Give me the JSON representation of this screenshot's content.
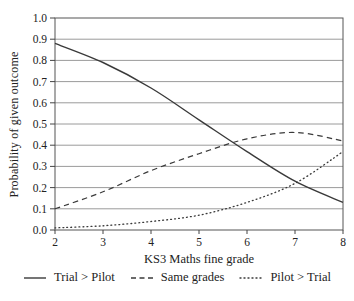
{
  "figure": {
    "background": "#ffffff"
  },
  "chart_data": {
    "type": "line",
    "x": [
      2,
      3,
      4,
      5,
      6,
      7,
      8
    ],
    "series": [
      {
        "name": "Trial > Pilot",
        "style": "solid",
        "values": [
          0.88,
          0.79,
          0.67,
          0.52,
          0.37,
          0.23,
          0.13
        ]
      },
      {
        "name": "Same grades",
        "style": "dashed",
        "values": [
          0.1,
          0.18,
          0.28,
          0.36,
          0.43,
          0.46,
          0.42
        ]
      },
      {
        "name": "Pilot > Trial",
        "style": "dotted",
        "values": [
          0.01,
          0.02,
          0.04,
          0.07,
          0.13,
          0.22,
          0.37
        ]
      }
    ],
    "title": "",
    "xlabel": "KS3 Maths fine grade",
    "ylabel": "Probability of given outcome",
    "xlim": [
      2,
      8
    ],
    "ylim": [
      0.0,
      1.0
    ],
    "x_ticks": [
      "2",
      "3",
      "4",
      "5",
      "6",
      "7",
      "8"
    ],
    "y_ticks": [
      "0.0",
      "0.1",
      "0.2",
      "0.3",
      "0.4",
      "0.5",
      "0.6",
      "0.7",
      "0.8",
      "0.9",
      "1.0"
    ],
    "grid": "horizontal",
    "legend_position": "bottom"
  },
  "legend": {
    "items": [
      {
        "label": "Trial > Pilot",
        "style": "solid"
      },
      {
        "label": "Same grades",
        "style": "dashed"
      },
      {
        "label": "Pilot > Trial",
        "style": "dotted"
      }
    ]
  },
  "colors": {
    "line": "#3a3a3a",
    "grid": "#8f8f8f",
    "axis": "#555555",
    "text": "#222222",
    "background": "#ffffff"
  }
}
